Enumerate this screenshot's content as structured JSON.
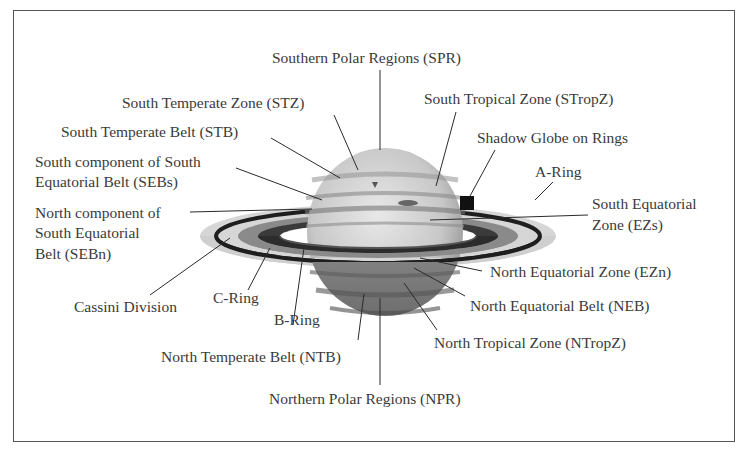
{
  "figure": {
    "labels": {
      "spr": "Southern Polar Regions (SPR)",
      "stz": "South Temperate Zone (STZ)",
      "stb": "South Temperate Belt (STB)",
      "sebs_line1": "South component of South",
      "sebs_line2": "Equatorial Belt (SEBs)",
      "sebn_line1": "North component of",
      "sebn_line2": "South Equatorial",
      "sebn_line3": "Belt (SEBn)",
      "cassini": "Cassini Division",
      "c_ring": "C-Ring",
      "b_ring": "B-Ring",
      "ntb": "North Temperate Belt (NTB)",
      "npr": "Northern Polar Regions (NPR)",
      "stropz": "South Tropical Zone (STropZ)",
      "shadow": "Shadow Globe on Rings",
      "a_ring": "A-Ring",
      "ezs_line1": "South Equatorial",
      "ezs_line2": "Zone (EZs)",
      "ezn": "North Equatorial Zone (EZn)",
      "neb": "North Equatorial Belt (NEB)",
      "ntropz": "North Tropical Zone (NTropZ)"
    }
  },
  "colors": {
    "frame": "#555555",
    "text": "#3a3a3a",
    "leader": "#2a2a2a"
  }
}
